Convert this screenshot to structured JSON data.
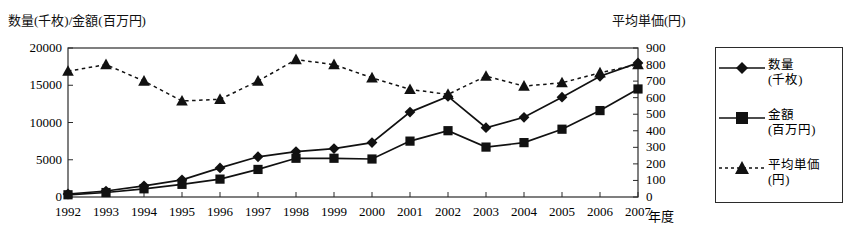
{
  "chart_data": {
    "type": "line",
    "title": "",
    "xlabel": "年度",
    "ylabel": "数量(千枚)/金額(百万円)",
    "y2label": "平均単価(円)",
    "grid": false,
    "legend_position": "right-outside",
    "ylim": [
      0,
      20000
    ],
    "y2lim": [
      0,
      900
    ],
    "y_ticks": [
      "0",
      "5000",
      "10000",
      "15000",
      "20000"
    ],
    "y2_ticks": [
      "0",
      "100",
      "200",
      "300",
      "400",
      "500",
      "600",
      "700",
      "800",
      "900"
    ],
    "categories": [
      "1992",
      "1993",
      "1994",
      "1995",
      "1996",
      "1997",
      "1998",
      "1999",
      "2000",
      "2001",
      "2002",
      "2003",
      "2004",
      "2005",
      "2006",
      "2007"
    ],
    "series": [
      {
        "name": "数量(千枚)",
        "axis": "left",
        "marker": "diamond",
        "line": "solid",
        "values": [
          400,
          800,
          1500,
          2300,
          3900,
          5400,
          6100,
          6500,
          7300,
          11400,
          13500,
          9300,
          10700,
          13400,
          16200,
          18000
        ]
      },
      {
        "name": "金額(百万円)",
        "axis": "left",
        "marker": "square",
        "line": "solid",
        "values": [
          300,
          600,
          1100,
          1700,
          2400,
          3700,
          5200,
          5200,
          5100,
          7500,
          8900,
          6700,
          7300,
          9100,
          11600,
          14500
        ]
      },
      {
        "name": "平均単価(円)",
        "axis": "right",
        "marker": "triangle",
        "line": "dashed",
        "values": [
          760,
          800,
          700,
          580,
          590,
          700,
          830,
          800,
          720,
          650,
          620,
          730,
          670,
          690,
          750,
          800
        ]
      }
    ]
  },
  "legend": {
    "items": [
      {
        "label_line1": "数量",
        "label_line2": "(千枚)"
      },
      {
        "label_line1": "金額",
        "label_line2": "(百万円)"
      },
      {
        "label_line1": "平均単価",
        "label_line2": "(円)"
      }
    ]
  }
}
